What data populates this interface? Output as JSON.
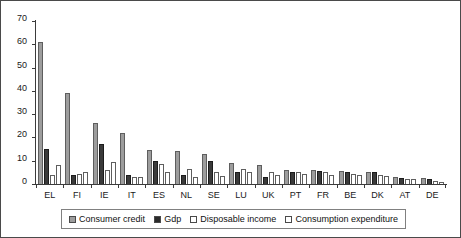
{
  "chart_data": {
    "type": "bar",
    "title": "",
    "xlabel": "",
    "ylabel": "",
    "ylim": [
      0,
      70
    ],
    "yticks": [
      0,
      10,
      20,
      30,
      40,
      50,
      60,
      70
    ],
    "grid": false,
    "legend_position": "bottom",
    "categories": [
      "EL",
      "FI",
      "IE",
      "IT",
      "ES",
      "NL",
      "SE",
      "LU",
      "UK",
      "PT",
      "FR",
      "BE",
      "DK",
      "AT",
      "DE"
    ],
    "series": [
      {
        "name": "Consumer credit",
        "color": "#9d9d9d",
        "values": [
          61,
          39,
          26,
          22,
          14.5,
          14,
          13,
          9,
          8,
          6,
          6,
          5.5,
          5,
          3,
          2.5
        ]
      },
      {
        "name": "Gdp",
        "color": "#3a3a3a",
        "values": [
          15,
          4,
          17,
          4,
          10,
          4,
          10,
          5,
          3,
          5,
          5.5,
          5,
          5,
          2.5,
          2
        ]
      },
      {
        "name": "Disposable income",
        "color": "#ffffff",
        "values": [
          4,
          4.5,
          6,
          3,
          8.5,
          6.5,
          5,
          6.5,
          5,
          5,
          5,
          4.5,
          4,
          2,
          1.5
        ]
      },
      {
        "name": "Consumption expenditure",
        "color": "#ffffff",
        "values": [
          8,
          5,
          9.5,
          3,
          5,
          3,
          3.5,
          5,
          4,
          4.5,
          4,
          4,
          3.5,
          2,
          1
        ]
      }
    ]
  },
  "legend": {
    "items": [
      {
        "label": "Consumer credit",
        "swatch": "legend-swatch-consumer-credit"
      },
      {
        "label": "Gdp",
        "swatch": "legend-swatch-gdp"
      },
      {
        "label": "Disposable income",
        "swatch": "legend-swatch-disposable-income"
      },
      {
        "label": "Consumption expenditure",
        "swatch": "legend-swatch-consumption-expenditure"
      }
    ]
  }
}
